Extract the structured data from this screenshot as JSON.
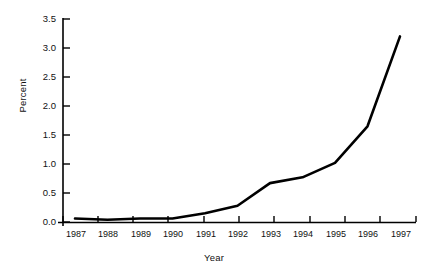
{
  "chart_data": {
    "type": "line",
    "title": "",
    "xlabel": "Year",
    "ylabel": "Percent",
    "x": [
      1987,
      1988,
      1989,
      1990,
      1991,
      1992,
      1993,
      1994,
      1995,
      1996,
      1997
    ],
    "categories": [
      "1987",
      "1988",
      "1989",
      "1990",
      "1991",
      "1992",
      "1993",
      "1994",
      "1995",
      "1996",
      "1997"
    ],
    "values": [
      0.06,
      0.04,
      0.06,
      0.06,
      0.15,
      0.28,
      0.67,
      0.77,
      1.02,
      1.65,
      3.2
    ],
    "series": [
      {
        "name": "Percent",
        "values": [
          0.06,
          0.04,
          0.06,
          0.06,
          0.15,
          0.28,
          0.67,
          0.77,
          1.02,
          1.65,
          3.2
        ],
        "color": "#000000"
      }
    ],
    "ylim": [
      0.0,
      3.5
    ],
    "yticks": [
      0.0,
      0.5,
      1.0,
      1.5,
      2.0,
      2.5,
      3.0,
      3.5
    ],
    "ytick_labels": [
      "0.0",
      "0.5",
      "1.0",
      "1.5",
      "2.0",
      "2.5",
      "3.0",
      "3.5"
    ],
    "xtick_labels": [
      "1987",
      "1988",
      "1989",
      "1990",
      "1991",
      "1992",
      "1993",
      "1994",
      "1995",
      "1996",
      "1997"
    ],
    "grid": false,
    "legend": "none",
    "line_color": "#000000",
    "axis_color": "#000000",
    "background_color": "#ffffff"
  }
}
